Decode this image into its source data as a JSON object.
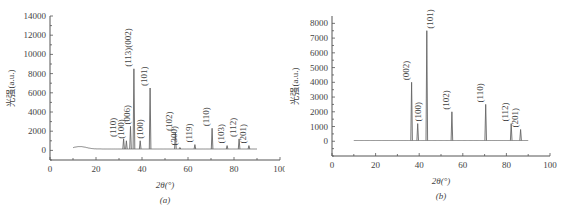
{
  "chart_data": [
    {
      "type": "line",
      "panel_label": "(a)",
      "title": "",
      "xlabel": "2θ(°)",
      "ylabel": "光强(a.u.)",
      "xlim": [
        0,
        100
      ],
      "ylim": [
        -1000,
        14000
      ],
      "xticks": [
        0,
        20,
        40,
        60,
        80,
        100
      ],
      "yticks": [
        0,
        2000,
        4000,
        6000,
        8000,
        10000,
        12000,
        14000
      ],
      "grid": false,
      "legend": null,
      "data_range": [
        10,
        90
      ],
      "baseline": 150,
      "peaks": [
        {
          "label": "(110)",
          "x": 32.0,
          "y": 1200
        },
        {
          "label": "(100)",
          "x": 33.2,
          "y": 1000
        },
        {
          "label": "(006)",
          "x": 35.0,
          "y": 2500
        },
        {
          "label": "(113)(002)",
          "x": 36.5,
          "y": 8500
        },
        {
          "label": "(100)",
          "x": 39.2,
          "y": 1000
        },
        {
          "label": "(101)",
          "x": 43.5,
          "y": 6500
        },
        {
          "label": "(102)",
          "x": 54.5,
          "y": 1800
        },
        {
          "label": "(300)",
          "x": 56.5,
          "y": 300
        },
        {
          "label": "(119)",
          "x": 63.0,
          "y": 600
        },
        {
          "label": "(110)",
          "x": 70.5,
          "y": 2300
        },
        {
          "label": "(103)",
          "x": 77.0,
          "y": 500
        },
        {
          "label": "(112)",
          "x": 82.2,
          "y": 1200
        },
        {
          "label": "(201)",
          "x": 86.5,
          "y": 500
        }
      ]
    },
    {
      "type": "line",
      "panel_label": "(b)",
      "title": "",
      "xlabel": "2θ(°)",
      "ylabel": "光强(a.u.)",
      "xlim": [
        0,
        100
      ],
      "ylim": [
        -1000,
        8500
      ],
      "xticks": [
        0,
        20,
        40,
        60,
        80,
        100
      ],
      "yticks": [
        0,
        1000,
        2000,
        3000,
        4000,
        5000,
        6000,
        7000,
        8000
      ],
      "grid": false,
      "legend": null,
      "data_range": [
        10,
        90
      ],
      "baseline": 50,
      "peaks": [
        {
          "label": "(002)",
          "x": 36.5,
          "y": 4000
        },
        {
          "label": "(100)",
          "x": 39.3,
          "y": 1200
        },
        {
          "label": "(101)",
          "x": 43.5,
          "y": 7500
        },
        {
          "label": "(102)",
          "x": 55.0,
          "y": 2000
        },
        {
          "label": "(110)",
          "x": 70.5,
          "y": 2500
        },
        {
          "label": "(112)",
          "x": 82.2,
          "y": 1200
        },
        {
          "label": "(201)",
          "x": 86.5,
          "y": 800
        }
      ]
    }
  ]
}
